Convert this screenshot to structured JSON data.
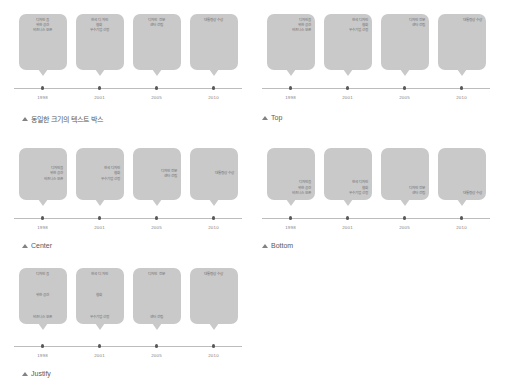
{
  "entries": [
    {
      "year": "1998",
      "lines": [
        "디자인을",
        "위한 공간",
        "비즈니스 오픈"
      ]
    },
    {
      "year": "2001",
      "lines": [
        "한국 디자인",
        "협회",
        "우수기업 선정"
      ]
    },
    {
      "year": "2005",
      "lines": [
        "디자인 전문",
        "센터 건립"
      ]
    },
    {
      "year": "2010",
      "lines": [
        "대통령상 수상"
      ]
    }
  ],
  "panels": [
    {
      "id": "equal-size",
      "caption": "동일한 크기의 텍스트 박스",
      "valign": "v-equal",
      "halign": "t-center"
    },
    {
      "id": "top",
      "caption": "Top",
      "valign": "v-top",
      "halign": "t-right"
    },
    {
      "id": "center",
      "caption": "Center",
      "valign": "v-center",
      "halign": "t-right"
    },
    {
      "id": "bottom",
      "caption": "Bottom",
      "valign": "v-bottom",
      "halign": "t-right"
    },
    {
      "id": "justify",
      "caption": "Justify",
      "valign": "v-justify",
      "halign": "t-center"
    }
  ],
  "colors": {
    "bubble_fill": "#c9c9c9",
    "axis": "#bcbcbc",
    "dot": "#58595b",
    "text": "#6d6e71",
    "caption": "#58595b"
  }
}
